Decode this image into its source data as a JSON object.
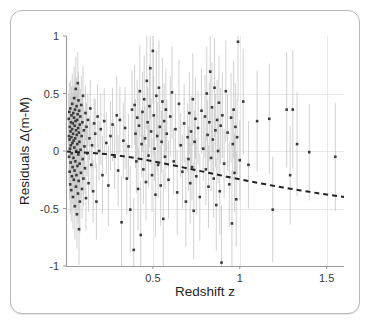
{
  "figure": {
    "card_label": "figure-card"
  },
  "chart_data": {
    "type": "scatter",
    "title": "",
    "subtitle": "",
    "xlabel": "Redshift z",
    "ylabel": "Residuals Δ(m-M)",
    "xlim": [
      0.0,
      1.6
    ],
    "ylim": [
      -1.0,
      1.0
    ],
    "xticks": [
      0.5,
      1,
      1.5
    ],
    "xticklabels": [
      "0.5",
      "1",
      "1.5"
    ],
    "yticks": [
      1,
      0.5,
      0,
      -0.5,
      -1
    ],
    "yticklabels": [
      "1",
      "0.5",
      "0",
      "-0.5",
      "-1"
    ],
    "grid": true,
    "grid_color": "#e2e2e2",
    "legend": null,
    "marker_color": "#3b3b3b",
    "errorbar_color": "#c2c2c2",
    "curve_color": "#222222",
    "curve_style": "dashed",
    "curve_label": "model residual curve",
    "curve": {
      "x": [
        0.0,
        0.05,
        0.1,
        0.15,
        0.2,
        0.25,
        0.3,
        0.35,
        0.4,
        0.45,
        0.5,
        0.55,
        0.6,
        0.65,
        0.7,
        0.75,
        0.8,
        0.85,
        0.9,
        0.95,
        1.0,
        1.05,
        1.1,
        1.15,
        1.2,
        1.25,
        1.3,
        1.35,
        1.4,
        1.45,
        1.5,
        1.55,
        1.6
      ],
      "y": [
        -0.005,
        -0.008,
        -0.012,
        -0.017,
        -0.023,
        -0.031,
        -0.04,
        -0.05,
        -0.062,
        -0.075,
        -0.089,
        -0.104,
        -0.119,
        -0.135,
        -0.151,
        -0.167,
        -0.183,
        -0.199,
        -0.215,
        -0.231,
        -0.246,
        -0.261,
        -0.276,
        -0.29,
        -0.304,
        -0.317,
        -0.33,
        -0.343,
        -0.355,
        -0.367,
        -0.378,
        -0.389,
        -0.4
      ]
    },
    "points": [
      {
        "x": 0.016,
        "y": 0.28,
        "e": 0.22
      },
      {
        "x": 0.017,
        "y": 0.13,
        "e": 0.2
      },
      {
        "x": 0.018,
        "y": -0.05,
        "e": 0.23
      },
      {
        "x": 0.019,
        "y": 0.34,
        "e": 0.25
      },
      {
        "x": 0.02,
        "y": 0.1,
        "e": 0.21
      },
      {
        "x": 0.021,
        "y": -0.18,
        "e": 0.24
      },
      {
        "x": 0.022,
        "y": 0.21,
        "e": 0.19
      },
      {
        "x": 0.023,
        "y": 0.02,
        "e": 0.22
      },
      {
        "x": 0.024,
        "y": -0.29,
        "e": 0.26
      },
      {
        "x": 0.025,
        "y": 0.37,
        "e": 0.24
      },
      {
        "x": 0.026,
        "y": 0.17,
        "e": 0.2
      },
      {
        "x": 0.027,
        "y": -0.1,
        "e": 0.21
      },
      {
        "x": 0.028,
        "y": 0.05,
        "e": 0.23
      },
      {
        "x": 0.029,
        "y": 0.25,
        "e": 0.22
      },
      {
        "x": 0.03,
        "y": -0.34,
        "e": 0.27
      },
      {
        "x": 0.031,
        "y": 0.12,
        "e": 0.19
      },
      {
        "x": 0.032,
        "y": 0.31,
        "e": 0.25
      },
      {
        "x": 0.033,
        "y": -0.02,
        "e": 0.2
      },
      {
        "x": 0.034,
        "y": -0.22,
        "e": 0.24
      },
      {
        "x": 0.035,
        "y": 0.19,
        "e": 0.21
      },
      {
        "x": 0.036,
        "y": 0.41,
        "e": 0.26
      },
      {
        "x": 0.037,
        "y": 0.07,
        "e": 0.19
      },
      {
        "x": 0.038,
        "y": -0.14,
        "e": 0.22
      },
      {
        "x": 0.039,
        "y": 0.24,
        "e": 0.23
      },
      {
        "x": 0.04,
        "y": -0.4,
        "e": 0.28
      },
      {
        "x": 0.041,
        "y": 0.15,
        "e": 0.2
      },
      {
        "x": 0.042,
        "y": 0.33,
        "e": 0.24
      },
      {
        "x": 0.043,
        "y": -0.06,
        "e": 0.21
      },
      {
        "x": 0.044,
        "y": 0.09,
        "e": 0.19
      },
      {
        "x": 0.045,
        "y": -0.25,
        "e": 0.25
      },
      {
        "x": 0.046,
        "y": 0.29,
        "e": 0.22
      },
      {
        "x": 0.047,
        "y": 0.46,
        "e": 0.27
      },
      {
        "x": 0.048,
        "y": 0.03,
        "e": 0.2
      },
      {
        "x": 0.049,
        "y": -0.17,
        "e": 0.23
      },
      {
        "x": 0.05,
        "y": 0.22,
        "e": 0.21
      },
      {
        "x": 0.051,
        "y": -0.48,
        "e": 0.29
      },
      {
        "x": 0.052,
        "y": 0.36,
        "e": 0.25
      },
      {
        "x": 0.053,
        "y": 0.11,
        "e": 0.19
      },
      {
        "x": 0.054,
        "y": -0.09,
        "e": 0.22
      },
      {
        "x": 0.055,
        "y": 0.26,
        "e": 0.23
      },
      {
        "x": 0.056,
        "y": 0.54,
        "e": 0.28
      },
      {
        "x": 0.057,
        "y": -0.31,
        "e": 0.26
      },
      {
        "x": 0.058,
        "y": 0.18,
        "e": 0.2
      },
      {
        "x": 0.059,
        "y": 0.0,
        "e": 0.21
      },
      {
        "x": 0.06,
        "y": -0.21,
        "e": 0.24
      },
      {
        "x": 0.061,
        "y": 0.39,
        "e": 0.25
      },
      {
        "x": 0.062,
        "y": 0.14,
        "e": 0.19
      },
      {
        "x": 0.063,
        "y": -0.55,
        "e": 0.3
      },
      {
        "x": 0.064,
        "y": 0.27,
        "e": 0.22
      },
      {
        "x": 0.065,
        "y": 0.06,
        "e": 0.2
      },
      {
        "x": 0.066,
        "y": -0.13,
        "e": 0.23
      },
      {
        "x": 0.067,
        "y": 0.32,
        "e": 0.24
      },
      {
        "x": 0.068,
        "y": 0.59,
        "e": 0.27
      },
      {
        "x": 0.069,
        "y": -0.37,
        "e": 0.26
      },
      {
        "x": 0.07,
        "y": 0.2,
        "e": 0.21
      },
      {
        "x": 0.071,
        "y": -0.03,
        "e": 0.19
      },
      {
        "x": 0.072,
        "y": 0.44,
        "e": 0.25
      },
      {
        "x": 0.073,
        "y": -0.26,
        "e": 0.24
      },
      {
        "x": 0.074,
        "y": 0.16,
        "e": 0.2
      },
      {
        "x": 0.075,
        "y": -0.68,
        "e": 0.31
      },
      {
        "x": 0.076,
        "y": 0.35,
        "e": 0.23
      },
      {
        "x": 0.077,
        "y": 0.08,
        "e": 0.19
      },
      {
        "x": 0.078,
        "y": -0.11,
        "e": 0.22
      },
      {
        "x": 0.079,
        "y": 0.23,
        "e": 0.21
      },
      {
        "x": 0.08,
        "y": -0.44,
        "e": 0.27
      },
      {
        "x": 0.082,
        "y": 0.3,
        "e": 0.24
      },
      {
        "x": 0.084,
        "y": 0.01,
        "e": 0.2
      },
      {
        "x": 0.086,
        "y": -0.19,
        "e": 0.23
      },
      {
        "x": 0.088,
        "y": 0.4,
        "e": 0.25
      },
      {
        "x": 0.09,
        "y": 0.13,
        "e": 0.19
      },
      {
        "x": 0.092,
        "y": -0.33,
        "e": 0.26
      },
      {
        "x": 0.094,
        "y": 0.25,
        "e": 0.22
      },
      {
        "x": 0.096,
        "y": -0.07,
        "e": 0.21
      },
      {
        "x": 0.098,
        "y": 0.48,
        "e": 0.26
      },
      {
        "x": 0.1,
        "y": -0.24,
        "e": 0.24
      },
      {
        "x": 0.103,
        "y": 0.18,
        "e": 0.2
      },
      {
        "x": 0.106,
        "y": 0.04,
        "e": 0.19
      },
      {
        "x": 0.109,
        "y": -0.15,
        "e": 0.23
      },
      {
        "x": 0.112,
        "y": 0.33,
        "e": 0.24
      },
      {
        "x": 0.115,
        "y": -0.41,
        "e": 0.28
      },
      {
        "x": 0.118,
        "y": 0.21,
        "e": 0.21
      },
      {
        "x": 0.122,
        "y": -0.02,
        "e": 0.2
      },
      {
        "x": 0.126,
        "y": 0.27,
        "e": 0.23
      },
      {
        "x": 0.13,
        "y": -0.28,
        "e": 0.25
      },
      {
        "x": 0.135,
        "y": 0.11,
        "e": 0.19
      },
      {
        "x": 0.14,
        "y": 0.37,
        "e": 0.25
      },
      {
        "x": 0.145,
        "y": -0.12,
        "e": 0.22
      },
      {
        "x": 0.15,
        "y": 0.05,
        "e": 0.2
      },
      {
        "x": 0.156,
        "y": -0.35,
        "e": 0.27
      },
      {
        "x": 0.162,
        "y": 0.24,
        "e": 0.22
      },
      {
        "x": 0.168,
        "y": 0.15,
        "e": 0.3
      },
      {
        "x": 0.175,
        "y": -0.44,
        "e": 0.33
      },
      {
        "x": 0.182,
        "y": 0.3,
        "e": 0.28
      },
      {
        "x": 0.19,
        "y": 0.0,
        "e": 0.26
      },
      {
        "x": 0.2,
        "y": 0.19,
        "e": 0.31
      },
      {
        "x": 0.21,
        "y": -0.21,
        "e": 0.34
      },
      {
        "x": 0.22,
        "y": 0.26,
        "e": 0.29
      },
      {
        "x": 0.232,
        "y": 0.07,
        "e": 0.27
      },
      {
        "x": 0.244,
        "y": -0.3,
        "e": 0.35
      },
      {
        "x": 0.256,
        "y": 0.13,
        "e": 0.3
      },
      {
        "x": 0.268,
        "y": 0.23,
        "e": 0.32
      },
      {
        "x": 0.28,
        "y": -0.05,
        "e": 0.28
      },
      {
        "x": 0.292,
        "y": 0.31,
        "e": 0.34
      },
      {
        "x": 0.3,
        "y": -0.17,
        "e": 0.31
      },
      {
        "x": 0.31,
        "y": 0.27,
        "e": 0.29
      },
      {
        "x": 0.32,
        "y": -0.62,
        "e": 0.4
      },
      {
        "x": 0.33,
        "y": 0.09,
        "e": 0.33
      },
      {
        "x": 0.34,
        "y": 0.2,
        "e": 0.36
      },
      {
        "x": 0.35,
        "y": -0.24,
        "e": 0.31
      },
      {
        "x": 0.36,
        "y": 0.04,
        "e": 0.28
      },
      {
        "x": 0.37,
        "y": -0.51,
        "e": 0.38
      },
      {
        "x": 0.38,
        "y": 0.36,
        "e": 0.34
      },
      {
        "x": 0.39,
        "y": -0.86,
        "e": 0.45
      },
      {
        "x": 0.395,
        "y": 0.4,
        "e": 0.35
      },
      {
        "x": 0.4,
        "y": 0.15,
        "e": 0.3
      },
      {
        "x": 0.405,
        "y": -0.09,
        "e": 0.28
      },
      {
        "x": 0.41,
        "y": 0.29,
        "e": 0.33
      },
      {
        "x": 0.415,
        "y": -0.33,
        "e": 0.36
      },
      {
        "x": 0.42,
        "y": 0.22,
        "e": 0.31
      },
      {
        "x": 0.425,
        "y": 0.52,
        "e": 0.4
      },
      {
        "x": 0.43,
        "y": -0.73,
        "e": 0.47
      },
      {
        "x": 0.435,
        "y": 0.06,
        "e": 0.29
      },
      {
        "x": 0.44,
        "y": 0.34,
        "e": 0.35
      },
      {
        "x": 0.445,
        "y": -0.16,
        "e": 0.3
      },
      {
        "x": 0.45,
        "y": 0.45,
        "e": 0.38
      },
      {
        "x": 0.455,
        "y": 0.11,
        "e": 0.28
      },
      {
        "x": 0.46,
        "y": -0.27,
        "e": 0.33
      },
      {
        "x": 0.465,
        "y": 0.61,
        "e": 0.42
      },
      {
        "x": 0.47,
        "y": 0.25,
        "e": 0.31
      },
      {
        "x": 0.475,
        "y": -0.04,
        "e": 0.27
      },
      {
        "x": 0.48,
        "y": 0.39,
        "e": 0.36
      },
      {
        "x": 0.485,
        "y": 0.72,
        "e": 0.44
      },
      {
        "x": 0.49,
        "y": 0.17,
        "e": 0.29
      },
      {
        "x": 0.495,
        "y": -0.21,
        "e": 0.32
      },
      {
        "x": 0.5,
        "y": 0.87,
        "e": 0.46
      },
      {
        "x": 0.505,
        "y": 0.31,
        "e": 0.34
      },
      {
        "x": 0.51,
        "y": 0.02,
        "e": 0.28
      },
      {
        "x": 0.515,
        "y": -0.38,
        "e": 0.37
      },
      {
        "x": 0.52,
        "y": 0.48,
        "e": 0.39
      },
      {
        "x": 0.525,
        "y": 0.13,
        "e": 0.3
      },
      {
        "x": 0.53,
        "y": -0.12,
        "e": 0.29
      },
      {
        "x": 0.535,
        "y": 0.55,
        "e": 0.41
      },
      {
        "x": 0.54,
        "y": 0.21,
        "e": 0.32
      },
      {
        "x": 0.545,
        "y": -0.3,
        "e": 0.35
      },
      {
        "x": 0.55,
        "y": 0.08,
        "e": 0.27
      },
      {
        "x": 0.555,
        "y": 0.43,
        "e": 0.38
      },
      {
        "x": 0.56,
        "y": -0.59,
        "e": 0.43
      },
      {
        "x": 0.565,
        "y": 0.26,
        "e": 0.33
      },
      {
        "x": 0.57,
        "y": -0.05,
        "e": 0.28
      },
      {
        "x": 0.575,
        "y": 0.36,
        "e": 0.36
      },
      {
        "x": 0.58,
        "y": 0.15,
        "e": 0.3
      },
      {
        "x": 0.59,
        "y": -0.25,
        "e": 0.34
      },
      {
        "x": 0.6,
        "y": 0.3,
        "e": 0.35
      },
      {
        "x": 0.61,
        "y": 0.51,
        "e": 0.4
      },
      {
        "x": 0.62,
        "y": -0.09,
        "e": 0.29
      },
      {
        "x": 0.63,
        "y": 0.19,
        "e": 0.31
      },
      {
        "x": 0.64,
        "y": -0.36,
        "e": 0.37
      },
      {
        "x": 0.65,
        "y": 0.41,
        "e": 0.38
      },
      {
        "x": 0.66,
        "y": 0.05,
        "e": 0.28
      },
      {
        "x": 0.67,
        "y": -0.18,
        "e": 0.32
      },
      {
        "x": 0.68,
        "y": 0.24,
        "e": 0.34
      },
      {
        "x": 0.69,
        "y": -0.44,
        "e": 0.39
      },
      {
        "x": 0.7,
        "y": 0.12,
        "e": 0.3
      },
      {
        "x": 0.705,
        "y": -0.07,
        "e": 0.28
      },
      {
        "x": 0.71,
        "y": 0.33,
        "e": 0.36
      },
      {
        "x": 0.715,
        "y": -0.28,
        "e": 0.35
      },
      {
        "x": 0.72,
        "y": 0.17,
        "e": 0.31
      },
      {
        "x": 0.725,
        "y": -0.14,
        "e": 0.29
      },
      {
        "x": 0.73,
        "y": 0.45,
        "e": 0.4
      },
      {
        "x": 0.735,
        "y": -0.52,
        "e": 0.42
      },
      {
        "x": 0.74,
        "y": 0.08,
        "e": 0.27
      },
      {
        "x": 0.745,
        "y": 0.28,
        "e": 0.35
      },
      {
        "x": 0.75,
        "y": -0.22,
        "e": 0.33
      },
      {
        "x": 0.76,
        "y": 0.2,
        "e": 0.32
      },
      {
        "x": 0.77,
        "y": -0.4,
        "e": 0.38
      },
      {
        "x": 0.78,
        "y": 0.35,
        "e": 0.37
      },
      {
        "x": 0.79,
        "y": 0.02,
        "e": 0.28
      },
      {
        "x": 0.8,
        "y": 0.3,
        "e": 0.36
      },
      {
        "x": 0.805,
        "y": -0.16,
        "e": 0.31
      },
      {
        "x": 0.81,
        "y": 0.5,
        "e": 0.41
      },
      {
        "x": 0.815,
        "y": 0.14,
        "e": 0.3
      },
      {
        "x": 0.82,
        "y": -0.31,
        "e": 0.36
      },
      {
        "x": 0.825,
        "y": 0.25,
        "e": 0.34
      },
      {
        "x": 0.83,
        "y": 0.69,
        "e": 0.45
      },
      {
        "x": 0.835,
        "y": -0.06,
        "e": 0.29
      },
      {
        "x": 0.84,
        "y": 0.38,
        "e": 0.39
      },
      {
        "x": 0.845,
        "y": 0.1,
        "e": 0.28
      },
      {
        "x": 0.85,
        "y": -0.24,
        "e": 0.34
      },
      {
        "x": 0.855,
        "y": 0.55,
        "e": 0.43
      },
      {
        "x": 0.86,
        "y": 0.18,
        "e": 0.32
      },
      {
        "x": 0.865,
        "y": -0.47,
        "e": 0.4
      },
      {
        "x": 0.87,
        "y": 0.27,
        "e": 0.35
      },
      {
        "x": 0.875,
        "y": 0.0,
        "e": 0.28
      },
      {
        "x": 0.88,
        "y": 0.42,
        "e": 0.41
      },
      {
        "x": 0.885,
        "y": -0.35,
        "e": 0.38
      },
      {
        "x": 0.89,
        "y": 0.22,
        "e": 0.33
      },
      {
        "x": 0.895,
        "y": -0.97,
        "e": 0.5
      },
      {
        "x": 0.9,
        "y": 0.31,
        "e": 0.37
      },
      {
        "x": 0.91,
        "y": -0.11,
        "e": 0.3
      },
      {
        "x": 0.92,
        "y": 0.52,
        "e": 0.44
      },
      {
        "x": 0.93,
        "y": 0.16,
        "e": 0.33
      },
      {
        "x": 0.94,
        "y": -0.29,
        "e": 0.37
      },
      {
        "x": 0.95,
        "y": 0.29,
        "e": 0.39
      },
      {
        "x": 0.955,
        "y": -0.63,
        "e": 0.46
      },
      {
        "x": 0.96,
        "y": 0.06,
        "e": 0.31
      },
      {
        "x": 0.965,
        "y": 0.36,
        "e": 0.42
      },
      {
        "x": 0.97,
        "y": -0.19,
        "e": 0.34
      },
      {
        "x": 0.975,
        "y": 0.21,
        "e": 0.38
      },
      {
        "x": 0.98,
        "y": -0.42,
        "e": 0.41
      },
      {
        "x": 0.985,
        "y": 0.12,
        "e": 0.33
      },
      {
        "x": 0.99,
        "y": 0.95,
        "e": 0.52
      },
      {
        "x": 1.0,
        "y": -0.08,
        "e": 0.35
      },
      {
        "x": 1.02,
        "y": 0.43,
        "e": 0.46
      },
      {
        "x": 1.05,
        "y": -0.12,
        "e": 0.38
      },
      {
        "x": 1.1,
        "y": 0.26,
        "e": 0.44
      },
      {
        "x": 1.17,
        "y": 0.28,
        "e": 0.48
      },
      {
        "x": 1.19,
        "y": -0.51,
        "e": 0.46
      },
      {
        "x": 1.27,
        "y": 0.36,
        "e": 0.5
      },
      {
        "x": 1.29,
        "y": -0.21,
        "e": 0.43
      },
      {
        "x": 1.305,
        "y": 0.36,
        "e": 0.52
      },
      {
        "x": 1.33,
        "y": 0.06,
        "e": 0.45
      },
      {
        "x": 1.4,
        "y": -0.01,
        "e": 0.42
      },
      {
        "x": 1.55,
        "y": -0.05,
        "e": 0.47
      }
    ]
  }
}
